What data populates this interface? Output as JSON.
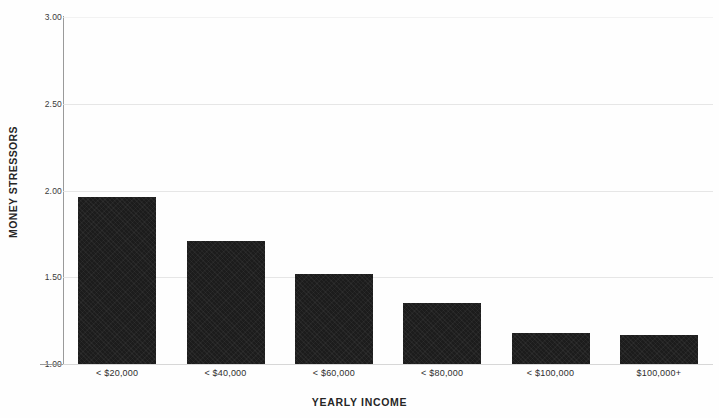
{
  "chart_data": {
    "type": "bar",
    "title": "",
    "subtitle": "",
    "xlabel": "YEARLY INCOME",
    "ylabel": "MONEY STRESSORS",
    "categories": [
      "< $20,000",
      "< $40,000",
      "< $60,000",
      "< $80,000",
      "< $100,000",
      "$100,000+"
    ],
    "values": [
      1.96,
      1.71,
      1.52,
      1.35,
      1.18,
      1.17
    ],
    "ylim": [
      1.0,
      3.0
    ],
    "ytick_values": [
      3.0,
      2.5,
      2.0,
      1.5,
      1.0
    ],
    "ytick_labels": [
      "3.00",
      "2.50",
      "2.00",
      "1.50",
      "1.00"
    ],
    "grid": true,
    "grid_axis": "y",
    "legend": false,
    "legend_position": "none",
    "bar_color": "#1c1c1c",
    "grid_color": "#e2e2e2",
    "axis_color": "#9a9a9a",
    "background_color": "#fefefe"
  }
}
